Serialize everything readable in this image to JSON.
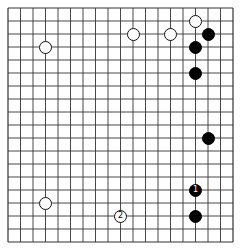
{
  "board": {
    "size": 19,
    "origin_x": 8,
    "origin_y": 8,
    "spacing_x": 12.5,
    "spacing_y": 13.0,
    "stone_diameter": 13,
    "line_color": "#333333",
    "background": "#ffffff"
  },
  "stones": [
    {
      "color": "white",
      "col": 3,
      "row": 3,
      "label": ""
    },
    {
      "color": "white",
      "col": 10,
      "row": 2,
      "label": ""
    },
    {
      "color": "white",
      "col": 13,
      "row": 2,
      "label": ""
    },
    {
      "color": "white",
      "col": 15,
      "row": 1,
      "label": ""
    },
    {
      "color": "black",
      "col": 16,
      "row": 2,
      "label": ""
    },
    {
      "color": "black",
      "col": 15,
      "row": 3,
      "label": ""
    },
    {
      "color": "black",
      "col": 15,
      "row": 5,
      "label": ""
    },
    {
      "color": "black",
      "col": 16,
      "row": 10,
      "label": ""
    },
    {
      "color": "black",
      "col": 15,
      "row": 14,
      "label": "1"
    },
    {
      "color": "black",
      "col": 15,
      "row": 16,
      "label": ""
    },
    {
      "color": "white",
      "col": 9,
      "row": 16,
      "label": "2"
    },
    {
      "color": "white",
      "col": 3,
      "row": 15,
      "label": ""
    }
  ]
}
